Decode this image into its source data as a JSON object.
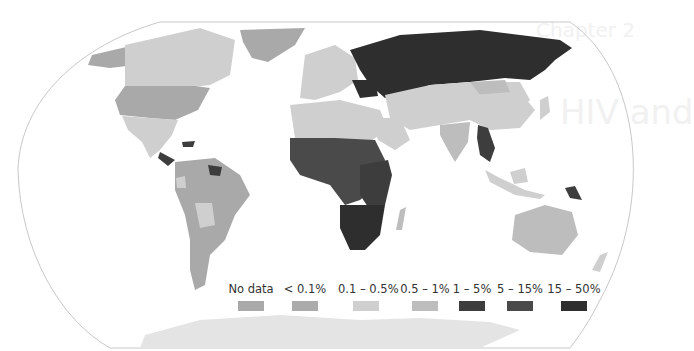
{
  "background_ghost_text": {
    "chapter": "Chapter 2",
    "heading": "HIV and"
  },
  "map": {
    "type": "choropleth world map",
    "subject": "HIV adult prevalence by country",
    "projection": "Robinson",
    "colors": {
      "no_data": "#a9a9a9",
      "lt_0_1": "#ababab",
      "0_1_0_5": "#cfcfcf",
      "0_5_1": "#bdbdbd",
      "1_5": "#3d3d3d",
      "5_15": "#4a4a4a",
      "15_50": "#2e2e2e",
      "outline": "#c8c8c8"
    }
  },
  "legend": {
    "items": [
      {
        "label": "No data",
        "color": "#a9a9a9"
      },
      {
        "label": "< 0.1%",
        "color": "#ababab"
      },
      {
        "label": "0.1 – 0.5%",
        "color": "#cfcfcf"
      },
      {
        "label": "0.5 – 1%",
        "color": "#bdbdbd"
      },
      {
        "label": "1 – 5%",
        "color": "#3d3d3d"
      },
      {
        "label": "5 – 15%",
        "color": "#4a4a4a"
      },
      {
        "label": "15 – 50%",
        "color": "#2e2e2e"
      }
    ]
  }
}
